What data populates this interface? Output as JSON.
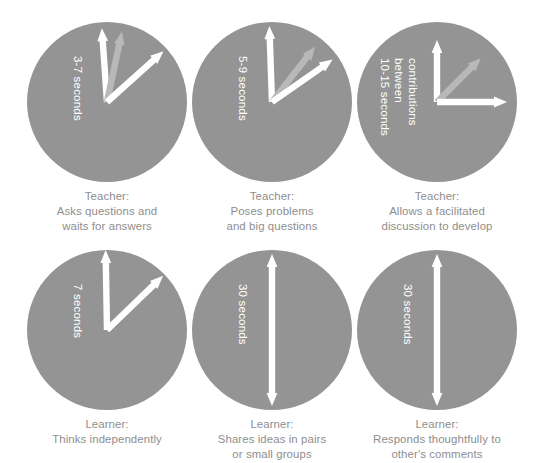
{
  "figure": {
    "background_color": "#ffffff",
    "circle_color": "#949494",
    "arrow_white_color": "#ffffff",
    "arrow_grey_color": "#b8b8b8",
    "caption_color": "#8e8e8e",
    "dial_label_color": "#ffffff"
  },
  "cells": [
    {
      "id": "teacher-asks-questions",
      "dial_label_lines": [
        "3-7 seconds"
      ],
      "caption_lines": [
        "Teacher:",
        "Asks questions and",
        "waits for answers"
      ],
      "arrows": [
        {
          "name": "white-arrow-vertical",
          "color": "#ffffff",
          "angle_deg": -4,
          "length": 74,
          "double": false
        },
        {
          "name": "grey-arrow-tilted",
          "color": "#b8b8b8",
          "angle_deg": 12,
          "length": 72,
          "double": false
        },
        {
          "name": "white-arrow-diagonal",
          "color": "#ffffff",
          "angle_deg": 48,
          "length": 76,
          "double": false
        }
      ]
    },
    {
      "id": "teacher-poses-problems",
      "dial_label_lines": [
        "5-9 seconds"
      ],
      "caption_lines": [
        "Teacher:",
        "Poses problems",
        "and big questions"
      ],
      "arrows": [
        {
          "name": "white-arrow-vertical",
          "color": "#ffffff",
          "angle_deg": -2,
          "length": 76,
          "double": false
        },
        {
          "name": "grey-arrow-tilted",
          "color": "#b8b8b8",
          "angle_deg": 38,
          "length": 70,
          "double": false
        },
        {
          "name": "white-arrow-diagonal",
          "color": "#ffffff",
          "angle_deg": 55,
          "length": 74,
          "double": false
        }
      ]
    },
    {
      "id": "teacher-allows-discussion",
      "dial_label_lines": [
        "10-15 seconds",
        "between",
        "contributions"
      ],
      "caption_lines": [
        "Teacher:",
        "Allows a facilitated",
        "discussion to develop"
      ],
      "arrows": [
        {
          "name": "white-arrow-vertical",
          "color": "#ffffff",
          "angle_deg": 0,
          "length": 62,
          "double": false
        },
        {
          "name": "grey-arrow-diagonal",
          "color": "#b8b8b8",
          "angle_deg": 45,
          "length": 62,
          "double": false
        },
        {
          "name": "white-arrow-horizontal",
          "color": "#ffffff",
          "angle_deg": 90,
          "length": 70,
          "double": false
        }
      ]
    },
    {
      "id": "learner-thinks-independently",
      "dial_label_lines": [
        "7 seconds"
      ],
      "caption_lines": [
        "Learner:",
        "Thinks independently"
      ],
      "arrows": [
        {
          "name": "white-arrow-vertical",
          "color": "#ffffff",
          "angle_deg": -1,
          "length": 80,
          "double": false
        },
        {
          "name": "white-arrow-diagonal",
          "color": "#ffffff",
          "angle_deg": 46,
          "length": 78,
          "double": false
        }
      ]
    },
    {
      "id": "learner-shares-ideas",
      "dial_label_lines": [
        "30 seconds"
      ],
      "caption_lines": [
        "Learner:",
        "Shares ideas in pairs",
        "or small groups"
      ],
      "arrows": [
        {
          "name": "white-arrow-double-vertical",
          "color": "#ffffff",
          "angle_deg": 0,
          "length": 152,
          "double": true
        }
      ]
    },
    {
      "id": "learner-responds-thoughtfully",
      "dial_label_lines": [
        "30 seconds"
      ],
      "caption_lines": [
        "Learner:",
        "Responds thoughtfully to",
        "other's comments"
      ],
      "arrows": [
        {
          "name": "white-arrow-double-vertical",
          "color": "#ffffff",
          "angle_deg": 0,
          "length": 152,
          "double": true
        }
      ]
    }
  ],
  "layout": {
    "columns": 3,
    "rows": 2,
    "col_x": [
      18,
      183,
      348
    ],
    "row_y": [
      22,
      250
    ],
    "circle_diameter": 160
  }
}
